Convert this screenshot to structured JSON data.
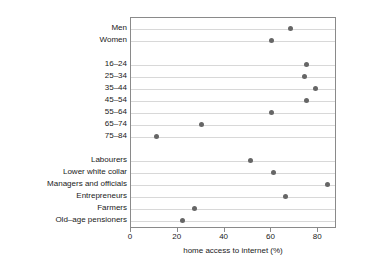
{
  "chart_data": {
    "type": "scatter",
    "title": "",
    "xlabel": "home access to internet (%)",
    "ylabel": "",
    "xlim": [
      0,
      88
    ],
    "ylim_categories": true,
    "grid": true,
    "legend": "none",
    "xticks": [
      0,
      20,
      40,
      60,
      80
    ],
    "xtick_labels": [
      "0",
      "20",
      "40",
      "60",
      "80"
    ],
    "marker": {
      "shape": "circle",
      "color": "#666666",
      "size_px": 5
    },
    "groups": [
      {
        "name": "sex",
        "categories": [
          "Men",
          "Women"
        ],
        "values": [
          68,
          60
        ]
      },
      {
        "name": "age",
        "categories": [
          "16–24",
          "25–34",
          "35–44",
          "45–54",
          "55–64",
          "65–74",
          "75–84"
        ],
        "values": [
          75,
          74,
          79,
          75,
          60,
          30,
          11
        ]
      },
      {
        "name": "occupation",
        "categories": [
          "Labourers",
          "Lower white collar",
          "Managers and officials",
          "Entrepreneurs",
          "Farmers",
          "Old–age pensioners"
        ],
        "values": [
          51,
          61,
          84,
          66,
          27,
          22
        ]
      }
    ],
    "rows": [
      {
        "label": "Men",
        "value": 68
      },
      {
        "label": "Women",
        "value": 60
      },
      {
        "label": "",
        "value": null
      },
      {
        "label": "16–24",
        "value": 75
      },
      {
        "label": "25–34",
        "value": 74
      },
      {
        "label": "35–44",
        "value": 79
      },
      {
        "label": "45–54",
        "value": 75
      },
      {
        "label": "55–64",
        "value": 60
      },
      {
        "label": "65–74",
        "value": 30
      },
      {
        "label": "75–84",
        "value": 11
      },
      {
        "label": "",
        "value": null
      },
      {
        "label": "Labourers",
        "value": 51
      },
      {
        "label": "Lower white collar",
        "value": 61
      },
      {
        "label": "Managers and officials",
        "value": 84
      },
      {
        "label": "Entrepreneurs",
        "value": 66
      },
      {
        "label": "Farmers",
        "value": 27
      },
      {
        "label": "Old–age pensioners",
        "value": 22
      }
    ]
  },
  "colors": {
    "marker": "#666666",
    "grid": "#d8d8d8",
    "frame": "#8a8a8a",
    "text": "#1a1a1a",
    "background": "#ffffff"
  }
}
